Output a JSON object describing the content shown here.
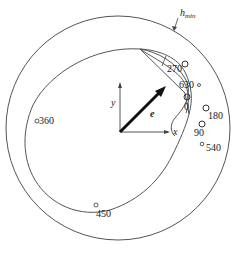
{
  "diagram": {
    "outer_boundary_label": "h",
    "outer_boundary_subscript": "min",
    "axes": {
      "x": "x",
      "y": "y"
    },
    "vector_label": "e",
    "points": [
      {
        "label": "270"
      },
      {
        "label": "630"
      },
      {
        "label": "0"
      },
      {
        "label": "180"
      },
      {
        "label": "90"
      },
      {
        "label": "540"
      },
      {
        "label": "360"
      },
      {
        "label": "450"
      }
    ],
    "colors": {
      "stroke": "#444444",
      "text": "#222222"
    }
  }
}
